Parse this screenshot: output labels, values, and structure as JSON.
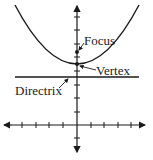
{
  "diagram": {
    "labels": {
      "focus": "Focus",
      "vertex": "Vertex",
      "directrix": "Directrix"
    },
    "axes": {
      "x_ticks_left": 5,
      "x_ticks_right": 4,
      "y_ticks_above": 8,
      "y_ticks_below": 1
    },
    "colors": {
      "stroke": "#1a1a1a",
      "background": "#ffffff"
    }
  }
}
